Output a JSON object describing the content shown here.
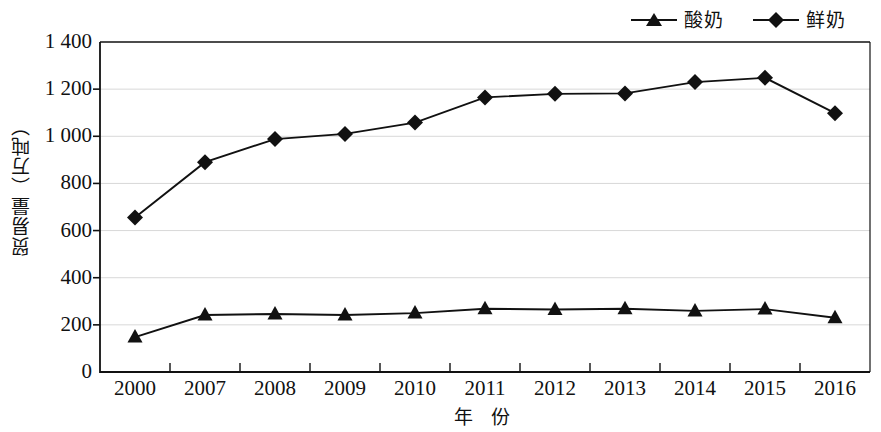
{
  "chart_data": {
    "type": "line",
    "title": "",
    "xlabel": "年 份",
    "ylabel": "贸易量（万吨）",
    "categories": [
      "2000",
      "2007",
      "2008",
      "2009",
      "2010",
      "2011",
      "2012",
      "2013",
      "2014",
      "2015",
      "2016"
    ],
    "ylim": [
      0,
      1400
    ],
    "ytick_labels": [
      "0",
      "200",
      "400",
      "600",
      "800",
      "1 000",
      "1 200",
      "1 400"
    ],
    "ytick_values": [
      0,
      200,
      400,
      600,
      800,
      1000,
      1200,
      1400
    ],
    "grid": true,
    "legend_position": "top-right",
    "series": [
      {
        "name": "酸奶",
        "marker": "triangle",
        "color": "#111111",
        "values": [
          148,
          242,
          246,
          242,
          250,
          268,
          265,
          268,
          259,
          267,
          230
        ]
      },
      {
        "name": "鲜奶",
        "marker": "diamond",
        "color": "#111111",
        "values": [
          655,
          890,
          988,
          1010,
          1058,
          1165,
          1180,
          1182,
          1230,
          1248,
          1098
        ]
      }
    ]
  },
  "legend": {
    "entries": [
      {
        "label": "酸奶",
        "marker": "triangle"
      },
      {
        "label": "鲜奶",
        "marker": "diamond"
      }
    ]
  },
  "axes": {
    "y_title": "贸易量（万吨）",
    "x_title": "年 份"
  },
  "colors": {
    "line": "#111111",
    "grid": "#d8d8d8",
    "axis": "#111111",
    "background": "#ffffff"
  }
}
